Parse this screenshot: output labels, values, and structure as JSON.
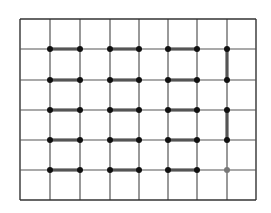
{
  "diagram": {
    "type": "grid-matching",
    "grid": {
      "x_lines": [
        20,
        50,
        80,
        110,
        139,
        168,
        197,
        227,
        256
      ],
      "y_lines": [
        19,
        49,
        80,
        110,
        140,
        170,
        200
      ],
      "line_color": "#555555",
      "border_color": "#333333"
    },
    "nodes": [
      {
        "c": 1,
        "r": 1
      },
      {
        "c": 2,
        "r": 1
      },
      {
        "c": 3,
        "r": 1
      },
      {
        "c": 4,
        "r": 1
      },
      {
        "c": 5,
        "r": 1
      },
      {
        "c": 6,
        "r": 1
      },
      {
        "c": 7,
        "r": 1
      },
      {
        "c": 1,
        "r": 2
      },
      {
        "c": 2,
        "r": 2
      },
      {
        "c": 3,
        "r": 2
      },
      {
        "c": 4,
        "r": 2
      },
      {
        "c": 5,
        "r": 2
      },
      {
        "c": 6,
        "r": 2
      },
      {
        "c": 7,
        "r": 2
      },
      {
        "c": 1,
        "r": 3
      },
      {
        "c": 2,
        "r": 3
      },
      {
        "c": 3,
        "r": 3
      },
      {
        "c": 4,
        "r": 3
      },
      {
        "c": 5,
        "r": 3
      },
      {
        "c": 6,
        "r": 3
      },
      {
        "c": 7,
        "r": 3
      },
      {
        "c": 1,
        "r": 4
      },
      {
        "c": 2,
        "r": 4
      },
      {
        "c": 3,
        "r": 4
      },
      {
        "c": 4,
        "r": 4
      },
      {
        "c": 5,
        "r": 4
      },
      {
        "c": 6,
        "r": 4
      },
      {
        "c": 7,
        "r": 4
      },
      {
        "c": 1,
        "r": 5
      },
      {
        "c": 2,
        "r": 5
      },
      {
        "c": 3,
        "r": 5
      },
      {
        "c": 4,
        "r": 5
      },
      {
        "c": 5,
        "r": 5
      },
      {
        "c": 6,
        "r": 5
      },
      {
        "c": 7,
        "r": 5,
        "faded": true
      }
    ],
    "edges": [
      {
        "from": [
          1,
          1
        ],
        "to": [
          2,
          1
        ]
      },
      {
        "from": [
          3,
          1
        ],
        "to": [
          4,
          1
        ]
      },
      {
        "from": [
          5,
          1
        ],
        "to": [
          6,
          1
        ]
      },
      {
        "from": [
          1,
          2
        ],
        "to": [
          2,
          2
        ]
      },
      {
        "from": [
          3,
          2
        ],
        "to": [
          4,
          2
        ]
      },
      {
        "from": [
          5,
          2
        ],
        "to": [
          6,
          2
        ]
      },
      {
        "from": [
          1,
          3
        ],
        "to": [
          2,
          3
        ]
      },
      {
        "from": [
          3,
          3
        ],
        "to": [
          4,
          3
        ]
      },
      {
        "from": [
          5,
          3
        ],
        "to": [
          6,
          3
        ]
      },
      {
        "from": [
          1,
          4
        ],
        "to": [
          2,
          4
        ]
      },
      {
        "from": [
          3,
          4
        ],
        "to": [
          4,
          4
        ]
      },
      {
        "from": [
          5,
          4
        ],
        "to": [
          6,
          4
        ]
      },
      {
        "from": [
          1,
          5
        ],
        "to": [
          2,
          5
        ]
      },
      {
        "from": [
          3,
          5
        ],
        "to": [
          4,
          5
        ]
      },
      {
        "from": [
          5,
          5
        ],
        "to": [
          6,
          5
        ]
      },
      {
        "from": [
          7,
          1
        ],
        "to": [
          7,
          2
        ]
      },
      {
        "from": [
          7,
          3
        ],
        "to": [
          7,
          4
        ]
      }
    ],
    "node_color": "#111111",
    "faded_node_color": "#777777",
    "edge_color": "#555555"
  }
}
